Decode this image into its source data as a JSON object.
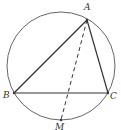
{
  "diagram": {
    "colors": {
      "stroke": "#333333",
      "circle": "#666666",
      "background": "#ffffff"
    },
    "circle": {
      "cx": 61,
      "cy": 66,
      "r": 54
    },
    "points": {
      "A": {
        "label": "A",
        "x": 87,
        "y": 20,
        "lx": 84,
        "ly": 10
      },
      "B": {
        "label": "B",
        "x": 14,
        "y": 93,
        "lx": 3,
        "ly": 98
      },
      "C": {
        "label": "C",
        "x": 108,
        "y": 93,
        "lx": 110,
        "ly": 99
      },
      "M": {
        "label": "M",
        "x": 61,
        "y": 120,
        "lx": 55,
        "ly": 130
      }
    },
    "segments": [
      {
        "from": "A",
        "to": "B",
        "style": "solid"
      },
      {
        "from": "B",
        "to": "C",
        "style": "solid"
      },
      {
        "from": "C",
        "to": "A",
        "style": "solid"
      },
      {
        "from": "A",
        "to": "M",
        "style": "dashed"
      }
    ]
  }
}
